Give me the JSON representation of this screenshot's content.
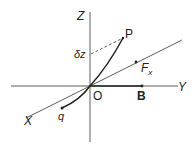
{
  "diagram": {
    "title": "",
    "axes": {
      "z": {
        "label": "Z"
      },
      "y": {
        "label": "Y"
      },
      "x": {
        "label": "X"
      }
    },
    "points": {
      "origin": {
        "label": "O"
      },
      "p": {
        "label": "P"
      },
      "b": {
        "label": "B"
      },
      "q": {
        "label": "q"
      }
    },
    "annotations": {
      "delta_z": "δz",
      "force": "F",
      "force_sub": "x"
    },
    "colors": {
      "line": "#333333",
      "background": "#ffffff"
    }
  }
}
